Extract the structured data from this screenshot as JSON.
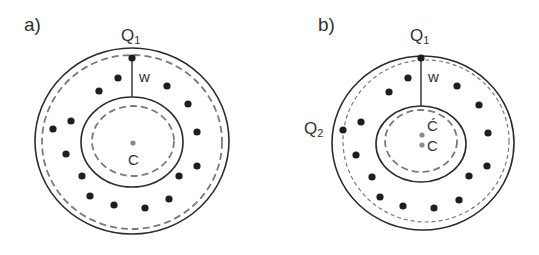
{
  "panels": [
    {
      "id": "a",
      "label": "a)",
      "label_pos": [
        24,
        31
      ],
      "outer_circle": {
        "cx": 132,
        "cy": 141,
        "rx": 97,
        "ry": 93
      },
      "outer_dashed": {
        "cx": 132,
        "cy": 142,
        "rx": 90,
        "ry": 87
      },
      "inner_ellipse": {
        "cx": 132,
        "cy": 142,
        "rx": 51,
        "ry": 45
      },
      "inner_dashed": {
        "cx": 133,
        "cy": 141,
        "rx": 41,
        "ry": 35
      },
      "w_line": {
        "x": 132,
        "y1": 58,
        "y2": 97
      },
      "w_label": "w",
      "w_label_pos": [
        139,
        82
      ],
      "q1": {
        "label": "Q",
        "sub": "1",
        "x": 132,
        "y": 58,
        "label_pos": [
          121,
          41
        ]
      },
      "centers": [
        {
          "label": "C",
          "x": 133,
          "y": 143,
          "label_pos": [
            128,
            165
          ]
        }
      ],
      "dots": [
        [
          118,
          78
        ],
        [
          99,
          91
        ],
        [
          167,
          86
        ],
        [
          188,
          104
        ],
        [
          71,
          121
        ],
        [
          53,
          129
        ],
        [
          197,
          132
        ],
        [
          66,
          154
        ],
        [
          197,
          166
        ],
        [
          82,
          176
        ],
        [
          179,
          176
        ],
        [
          90,
          196
        ],
        [
          169,
          199
        ],
        [
          114,
          205
        ],
        [
          145,
          208
        ]
      ]
    },
    {
      "id": "b",
      "label": "b)",
      "label_pos": [
        318,
        31
      ],
      "outer_circle": {
        "cx": 423,
        "cy": 143,
        "rx": 91,
        "ry": 87
      },
      "outer_dashed": {
        "cx": 426,
        "cy": 141,
        "rx": 83,
        "ry": 81
      },
      "inner_ellipse": {
        "cx": 421,
        "cy": 144,
        "rx": 45,
        "ry": 38
      },
      "inner_dashed": {
        "cx": 421,
        "cy": 141,
        "rx": 36,
        "ry": 31
      },
      "w_line": {
        "x": 421,
        "y1": 58,
        "y2": 106
      },
      "w_label": "w",
      "w_label_pos": [
        428,
        82
      ],
      "q1": {
        "label": "Q",
        "sub": "1",
        "x": 421,
        "y": 58,
        "label_pos": [
          410,
          41
        ]
      },
      "q2": {
        "label": "Q",
        "sub": "2",
        "x": 343,
        "y": 130,
        "label_pos": [
          304,
          134
        ]
      },
      "centers": [
        {
          "label": "Ć",
          "x": 422,
          "y": 135,
          "label_pos": [
            427,
            131
          ]
        },
        {
          "label": "C",
          "x": 422,
          "y": 145,
          "label_pos": [
            427,
            151
          ]
        }
      ],
      "dots": [
        [
          408,
          78
        ],
        [
          389,
          92
        ],
        [
          457,
          86
        ],
        [
          479,
          105
        ],
        [
          361,
          122
        ],
        [
          488,
          133
        ],
        [
          356,
          155
        ],
        [
          487,
          166
        ],
        [
          372,
          177
        ],
        [
          469,
          176
        ],
        [
          380,
          197
        ],
        [
          459,
          200
        ],
        [
          403,
          206
        ],
        [
          434,
          208
        ]
      ]
    }
  ],
  "colors": {
    "line": "#2b2b2b",
    "dashed": "#7a7a7a",
    "dot": "#1e1e1e",
    "center_dot": "#8a8a8a",
    "text": "#333333"
  }
}
